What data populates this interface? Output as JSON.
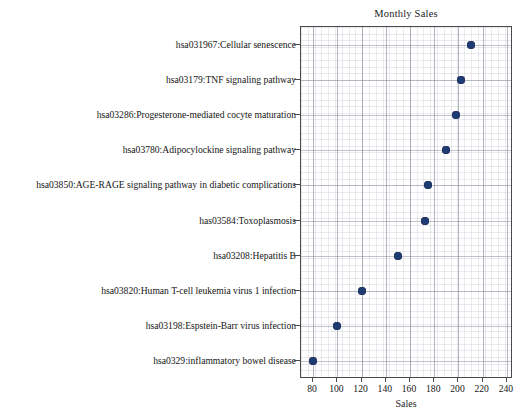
{
  "chart_data": {
    "type": "scatter",
    "title": "Monthly Sales",
    "xlabel": "Sales",
    "ylabel": "",
    "orientation": "horizontal",
    "grid": true,
    "legend": false,
    "xlim": [
      70,
      245
    ],
    "xticks": [
      80,
      100,
      120,
      140,
      160,
      180,
      200,
      220,
      240
    ],
    "categories": [
      "hsa0329:inflammatory bowel disease",
      "hsa03198:Espstein-Barr virus infection",
      "hsa03820:Human T-cell leukemia virus 1 infection",
      "hsa03208:Hepatitis B",
      "has03584:Toxoplasmosis",
      "hsa03850:AGE-RAGE signaling pathway in diabetic complications",
      "hsa03780:Adipocylockine signaling pathway",
      "hsa03286:Progesterone-mediated cocyte maturation",
      "hsa03179:TNF signaling pathway",
      "hsa031967:Cellular senescence"
    ],
    "values": [
      80,
      100,
      120,
      150,
      172,
      175,
      190,
      198,
      202,
      210
    ],
    "marker_color": "#1f3b73",
    "point_labels": [
      "hsa031967:Cellular senescence",
      "hsa03179:TNF signaling pathway",
      "hsa03286:Progesterone-mediated cocyte maturation",
      "hsa03780:Adipocylockine signaling pathway",
      "hsa03850:AGE-RAGE signaling pathway in diabetic complications",
      "has03584:Toxoplasmosis",
      "hsa03208:Hepatitis B",
      "hsa03820:Human T-cell leukemia virus 1 infection",
      "hsa03198:Espstein-Barr virus infection",
      "hsa0329:inflammatory bowel disease"
    ]
  }
}
